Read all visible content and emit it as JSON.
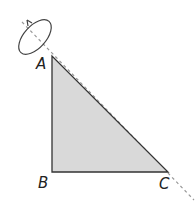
{
  "diagram": {
    "vertices": {
      "A": {
        "label": "A",
        "x": 52,
        "y": 56
      },
      "B": {
        "label": "B",
        "x": 52,
        "y": 172
      },
      "C": {
        "label": "C",
        "x": 168,
        "y": 172
      }
    },
    "axis": {
      "style": "dashed",
      "through": [
        "A",
        "C"
      ],
      "color": "#999999"
    },
    "rotation_indicator": {
      "shape": "ellipse-with-arrow",
      "color": "#444444"
    },
    "fill_color": "#d9d9d9",
    "stroke_color": "#333333"
  }
}
